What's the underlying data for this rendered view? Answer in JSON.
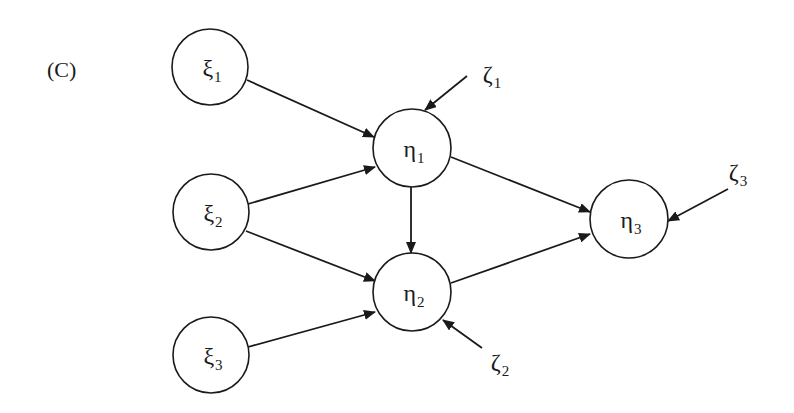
{
  "panel_label": "(C)",
  "colors": {
    "stroke": "#1a1a1a",
    "background": "#ffffff"
  },
  "nodes": [
    {
      "id": "xi1",
      "symbol": "ξ",
      "sub": "1",
      "cx": 210,
      "cy": 67,
      "r": 38
    },
    {
      "id": "xi2",
      "symbol": "ξ",
      "sub": "2",
      "cx": 211,
      "cy": 212,
      "r": 38
    },
    {
      "id": "xi3",
      "symbol": "ξ",
      "sub": "3",
      "cx": 211,
      "cy": 355,
      "r": 38
    },
    {
      "id": "eta1",
      "symbol": "η",
      "sub": "1",
      "cx": 412,
      "cy": 148,
      "r": 39
    },
    {
      "id": "eta2",
      "symbol": "η",
      "sub": "2",
      "cx": 412,
      "cy": 292,
      "r": 39
    },
    {
      "id": "eta3",
      "symbol": "η",
      "sub": "3",
      "cx": 629,
      "cy": 219,
      "r": 39
    }
  ],
  "errors": [
    {
      "id": "zeta1",
      "symbol": "ζ",
      "sub": "1",
      "x": 492,
      "y": 74
    },
    {
      "id": "zeta2",
      "symbol": "ζ",
      "sub": "2",
      "x": 500,
      "y": 362
    },
    {
      "id": "zeta3",
      "symbol": "ζ",
      "sub": "3",
      "x": 738,
      "y": 172
    }
  ],
  "edges": [
    {
      "from": "xi1",
      "to": "eta1",
      "x1": 247,
      "y1": 80,
      "x2": 374,
      "y2": 137
    },
    {
      "from": "xi2",
      "to": "eta1",
      "x1": 248,
      "y1": 204,
      "x2": 375,
      "y2": 167
    },
    {
      "from": "xi2",
      "to": "eta2",
      "x1": 246,
      "y1": 231,
      "x2": 375,
      "y2": 281
    },
    {
      "from": "xi3",
      "to": "eta2",
      "x1": 248,
      "y1": 347,
      "x2": 375,
      "y2": 312
    },
    {
      "from": "eta1",
      "to": "eta2",
      "x1": 411,
      "y1": 187,
      "x2": 411,
      "y2": 253
    },
    {
      "from": "eta1",
      "to": "eta3",
      "x1": 451,
      "y1": 157,
      "x2": 590,
      "y2": 212
    },
    {
      "from": "eta2",
      "to": "eta3",
      "x1": 451,
      "y1": 283,
      "x2": 590,
      "y2": 234
    },
    {
      "from": "zeta1",
      "to": "eta1",
      "x1": 467,
      "y1": 76,
      "x2": 425,
      "y2": 110
    },
    {
      "from": "zeta2",
      "to": "eta2",
      "x1": 482,
      "y1": 348,
      "x2": 443,
      "y2": 320
    },
    {
      "from": "zeta3",
      "to": "eta3",
      "x1": 728,
      "y1": 189,
      "x2": 668,
      "y2": 221
    }
  ]
}
